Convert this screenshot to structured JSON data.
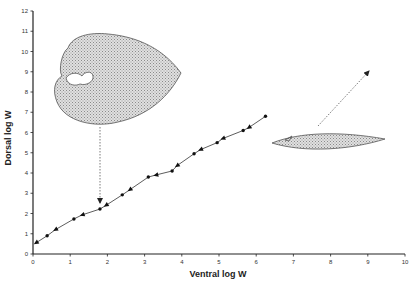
{
  "chart_data": {
    "type": "line",
    "title": "",
    "xlabel": "Ventral log W",
    "ylabel": "Dorsal log W",
    "xlim": [
      0,
      10
    ],
    "ylim": [
      0,
      12
    ],
    "xticks": [
      0,
      1,
      2,
      3,
      4,
      5,
      6,
      7,
      8,
      9,
      10
    ],
    "yticks": [
      0,
      1,
      2,
      3,
      4,
      5,
      6,
      7,
      8,
      9,
      10,
      11,
      12
    ],
    "grid": false,
    "legend": null,
    "series": [
      {
        "name": "growth trajectory",
        "markers": "alternating dots and arrowheads (arrows point toward origin)",
        "x": [
          0.08,
          0.38,
          0.6,
          1.1,
          1.32,
          1.8,
          1.96,
          2.4,
          2.6,
          3.1,
          3.3,
          3.74,
          3.87,
          4.33,
          4.5,
          4.95,
          5.1,
          5.65,
          5.8,
          6.25
        ],
        "y": [
          0.55,
          0.9,
          1.2,
          1.73,
          1.93,
          2.22,
          2.4,
          2.92,
          3.17,
          3.8,
          3.9,
          4.1,
          4.36,
          4.95,
          5.15,
          5.5,
          5.7,
          6.1,
          6.24,
          6.8
        ]
      }
    ],
    "annotations": [
      {
        "type": "illustration",
        "name": "coiled shell (heart-shaped outline, stippled)",
        "position": "upper-left, around x=1.5-4, y=6.5-11",
        "arrow_to": [
          1.8,
          2.4
        ],
        "arrow_style": "dashed, vertical"
      },
      {
        "type": "illustration",
        "name": "elongated flat shell (lens-shaped, stippled)",
        "position": "right, around x=6.5-9.5, y=5.2-5.9",
        "arrow_to": [
          9.4,
          9.1
        ],
        "arrow_style": "dashed, diagonal up-right"
      }
    ]
  },
  "axes": {
    "x_title": "Ventral log W",
    "y_title": "Dorsal log W",
    "x_tick_labels": [
      "0",
      "1",
      "2",
      "3",
      "4",
      "5",
      "6",
      "7",
      "8",
      "9",
      "10"
    ],
    "y_tick_labels": [
      "0",
      "1",
      "2",
      "3",
      "4",
      "5",
      "6",
      "7",
      "8",
      "9",
      "10",
      "11",
      "12"
    ]
  },
  "colors": {
    "axis": "#222222",
    "line": "#333333",
    "shell_fill": "#c8c8c8",
    "shell_stroke": "#555555"
  }
}
